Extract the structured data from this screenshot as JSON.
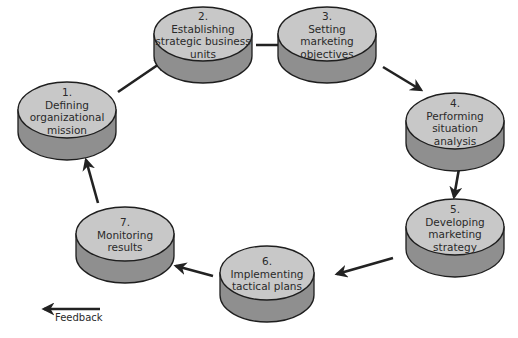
{
  "diagram": {
    "colors": {
      "top": "#c8c8c8",
      "side": "#8f8f8f",
      "outline": "#1e1e1e",
      "arrow": "#222222"
    },
    "steps": [
      {
        "number": "1.",
        "lines": [
          "Defining",
          "organizational",
          "mission"
        ],
        "cx": 67,
        "cy": 110,
        "rx": 49,
        "ry": 28,
        "depth": 22
      },
      {
        "number": "2.",
        "lines": [
          "Establishing",
          "strategic business",
          "units"
        ],
        "cx": 203,
        "cy": 34,
        "rx": 49,
        "ry": 27,
        "depth": 22
      },
      {
        "number": "3.",
        "lines": [
          "Setting",
          "marketing",
          "objectives"
        ],
        "cx": 327,
        "cy": 34,
        "rx": 49,
        "ry": 27,
        "depth": 22
      },
      {
        "number": "4.",
        "lines": [
          "Performing",
          "situation",
          "analysis"
        ],
        "cx": 455,
        "cy": 121,
        "rx": 49,
        "ry": 28,
        "depth": 22
      },
      {
        "number": "5.",
        "lines": [
          "Developing",
          "marketing",
          "strategy"
        ],
        "cx": 455,
        "cy": 227,
        "rx": 49,
        "ry": 28,
        "depth": 22
      },
      {
        "number": "6.",
        "lines": [
          "Implementing",
          "tactical plans"
        ],
        "cx": 267,
        "cy": 273,
        "rx": 47,
        "ry": 27,
        "depth": 22
      },
      {
        "number": "7.",
        "lines": [
          "Monitoring",
          "results"
        ],
        "cx": 125,
        "cy": 234,
        "rx": 49,
        "ry": 27,
        "depth": 22
      }
    ],
    "arrows": [
      {
        "from": "1",
        "to": "2",
        "x1": 118,
        "y1": 92,
        "x2": 165,
        "y2": 60
      },
      {
        "from": "2",
        "to": "3",
        "x1": 256,
        "y1": 45,
        "x2": 294,
        "y2": 45
      },
      {
        "from": "3",
        "to": "4",
        "x1": 383,
        "y1": 67,
        "x2": 421,
        "y2": 90
      },
      {
        "from": "4",
        "to": "5",
        "x1": 460,
        "y1": 163,
        "x2": 454,
        "y2": 197
      },
      {
        "from": "5",
        "to": "6",
        "x1": 393,
        "y1": 258,
        "x2": 337,
        "y2": 274
      },
      {
        "from": "6",
        "to": "7",
        "x1": 213,
        "y1": 276,
        "x2": 176,
        "y2": 266
      },
      {
        "from": "7",
        "to": "1",
        "x1": 98,
        "y1": 203,
        "x2": 86,
        "y2": 160
      }
    ],
    "legend": {
      "label": "Feedback",
      "x1": 100,
      "y1": 309,
      "x2": 44,
      "y2": 309
    }
  }
}
